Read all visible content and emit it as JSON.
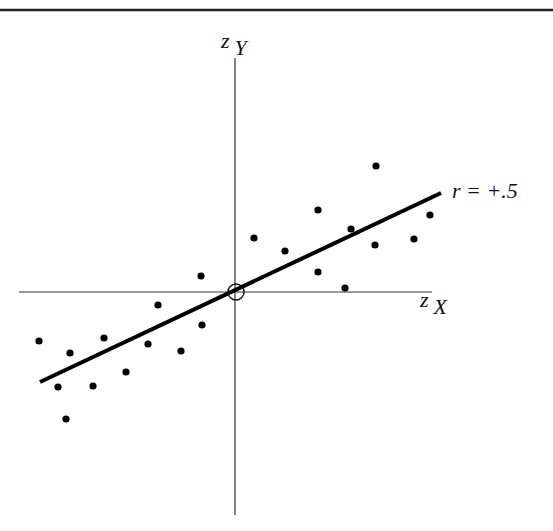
{
  "chart_data": {
    "type": "scatter",
    "title": "",
    "xlabel": "z_X",
    "ylabel": "z_Y",
    "annotation": "r = +.5",
    "grid": false,
    "legend": null,
    "note": "Standardized scatterplot with regression line through origin; coordinates in pixel space of 553x531 figure, origin at (236,292).",
    "origin_px": [
      236,
      292
    ],
    "points_px": [
      [
        39,
        341
      ],
      [
        58,
        387
      ],
      [
        66,
        419
      ],
      [
        70,
        353
      ],
      [
        93,
        386
      ],
      [
        104,
        338
      ],
      [
        126,
        372
      ],
      [
        148,
        344
      ],
      [
        158,
        305
      ],
      [
        181,
        351
      ],
      [
        202,
        325
      ],
      [
        201,
        276
      ],
      [
        254,
        238
      ],
      [
        285,
        251
      ],
      [
        318,
        210
      ],
      [
        318,
        272
      ],
      [
        345,
        288
      ],
      [
        351,
        229
      ],
      [
        376,
        166
      ],
      [
        375,
        245
      ],
      [
        414,
        239
      ],
      [
        430,
        215
      ]
    ],
    "regression_line_px": {
      "x1": 40,
      "y1": 382,
      "x2": 441,
      "y2": 193
    },
    "correlation": 0.5
  },
  "labels": {
    "y_axis_z": "z",
    "y_axis_sub": "Y",
    "x_axis_z": "z",
    "x_axis_sub": "X",
    "r_label": "r = +.5"
  }
}
